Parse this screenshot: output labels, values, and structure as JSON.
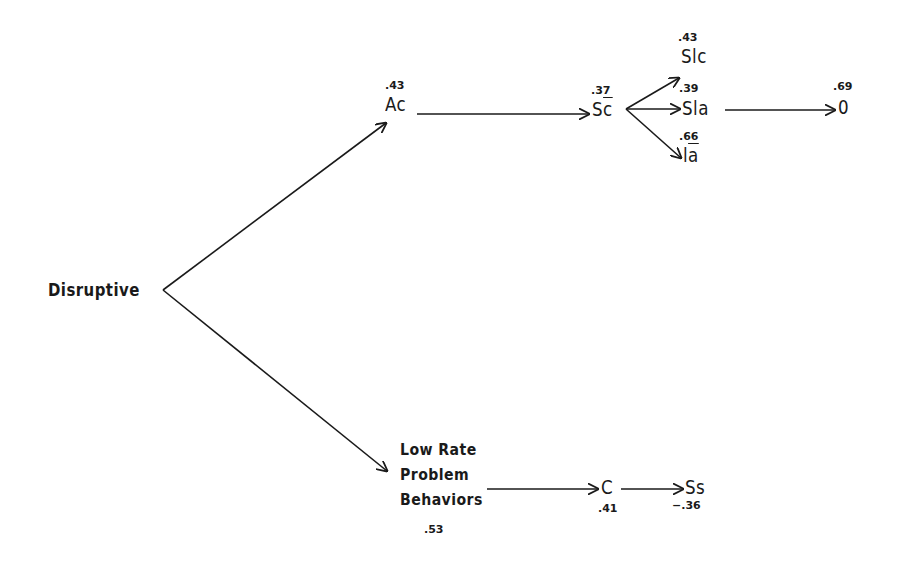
{
  "diagram": {
    "type": "path-diagram",
    "nodes": {
      "disruptive": {
        "label": "Disruptive"
      },
      "ac": {
        "label": "Ac",
        "coefficient": ".43"
      },
      "sc_bar": {
        "label_base": "S",
        "label_bar": "c",
        "coefficient": ".37"
      },
      "slc": {
        "label": "Slc",
        "coefficient": ".43"
      },
      "sla": {
        "label": "Sla",
        "coefficient": ".39"
      },
      "ia_bar": {
        "label_base": "l",
        "label_bar": "a",
        "coefficient": ".66"
      },
      "o": {
        "label": "0",
        "coefficient": ".69"
      },
      "low_rate": {
        "lines": [
          "Low Rate",
          "Problem",
          "Behaviors"
        ],
        "coefficient": ".53"
      },
      "c": {
        "label": "C",
        "coefficient": ".41"
      },
      "ss": {
        "label": "Ss",
        "coefficient": "−.36"
      }
    },
    "edges": [
      {
        "from": "Disruptive",
        "to": "Ac"
      },
      {
        "from": "Disruptive",
        "to": "Low Rate Problem Behaviors"
      },
      {
        "from": "Ac",
        "to": "Sc̄"
      },
      {
        "from": "Sc̄",
        "to": "Slc"
      },
      {
        "from": "Sc̄",
        "to": "Sla"
      },
      {
        "from": "Sc̄",
        "to": "Iā"
      },
      {
        "from": "Sla",
        "to": "0"
      },
      {
        "from": "Low Rate Problem Behaviors",
        "to": "C"
      },
      {
        "from": "C",
        "to": "Ss"
      }
    ],
    "colors": {
      "ink": "#1a1a1a",
      "background": "#ffffff"
    }
  }
}
